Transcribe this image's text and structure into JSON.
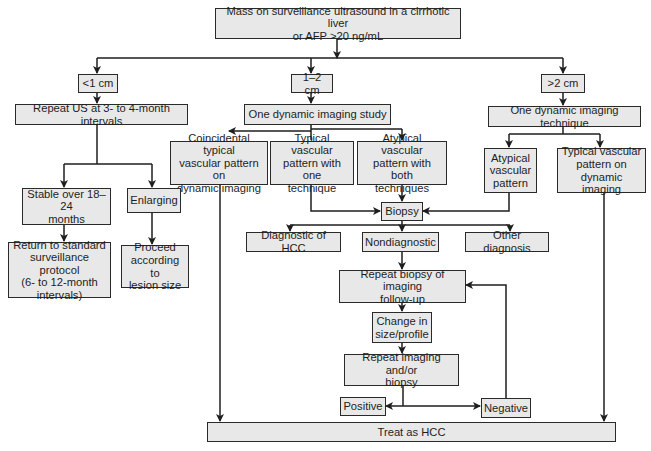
{
  "diagram": {
    "type": "flowchart",
    "colors": {
      "box_fill": "#e8e8e8",
      "box_border": "#2a2a2a",
      "line": "#1e1e1e",
      "text": "#1e1e1e",
      "background": "#ffffff"
    },
    "nodes": {
      "start": "Mass on surveillance ultrasound in a cirrhotic liver\nor AFP >20 ng/mL",
      "lt1": "<1 cm",
      "mid": "1–2 cm",
      "gt2": ">2 cm",
      "repeat_us": "Repeat US at 3- to 4-month intervals",
      "one_study": "One dynamic imaging study",
      "one_technique": "One dynamic imaging technique",
      "coincidental": "Coincidental typical\nvascular pattern on\ndynamic imaging",
      "typical_one": "Typical vascular\npattern with one\ntechnique",
      "atypical_both": "Atypical vascular\npattern with both\ntechniques",
      "atypical": "Atypical\nvascular\npattern",
      "typical_dynamic": "Typical vascular\npattern on\ndynamic imaging",
      "stable": "Stable over 18–24\nmonths",
      "enlarging": "Enlarging",
      "return": "Return to standard\nsurveillance protocol\n(6- to 12-month\nintervals)",
      "proceed": "Proceed\naccording to\nlesion size",
      "biopsy": "Biopsy",
      "diag_hcc": "Diagnostic of HCC",
      "nondiag": "Nondiagnostic",
      "other_diag": "Other diagnosis",
      "repeat_biopsy": "Repeat biopsy of imaging\nfollow-up",
      "change": "Change in\nsize/profile",
      "repeat_imaging": "Repeat imaging and/or\nbiopsy",
      "positive": "Positive",
      "negative": "Negative",
      "treat": "Treat as HCC"
    },
    "edges": [
      [
        "start",
        "lt1"
      ],
      [
        "start",
        "mid"
      ],
      [
        "start",
        "gt2"
      ],
      [
        "lt1",
        "repeat_us"
      ],
      [
        "mid",
        "one_study"
      ],
      [
        "gt2",
        "one_technique"
      ],
      [
        "repeat_us",
        "stable"
      ],
      [
        "repeat_us",
        "enlarging"
      ],
      [
        "stable",
        "return"
      ],
      [
        "enlarging",
        "proceed"
      ],
      [
        "one_study",
        "coincidental"
      ],
      [
        "one_study",
        "typical_one"
      ],
      [
        "one_study",
        "atypical_both"
      ],
      [
        "one_technique",
        "atypical"
      ],
      [
        "one_technique",
        "typical_dynamic"
      ],
      [
        "typical_one",
        "biopsy"
      ],
      [
        "atypical_both",
        "biopsy"
      ],
      [
        "atypical",
        "biopsy"
      ],
      [
        "biopsy",
        "diag_hcc"
      ],
      [
        "biopsy",
        "nondiag"
      ],
      [
        "biopsy",
        "other_diag"
      ],
      [
        "nondiag",
        "repeat_biopsy"
      ],
      [
        "repeat_biopsy",
        "change"
      ],
      [
        "change",
        "repeat_imaging"
      ],
      [
        "repeat_imaging",
        "positive"
      ],
      [
        "repeat_imaging",
        "negative"
      ],
      [
        "negative",
        "repeat_biopsy"
      ],
      [
        "coincidental",
        "treat"
      ],
      [
        "typical_dynamic",
        "treat"
      ]
    ]
  }
}
